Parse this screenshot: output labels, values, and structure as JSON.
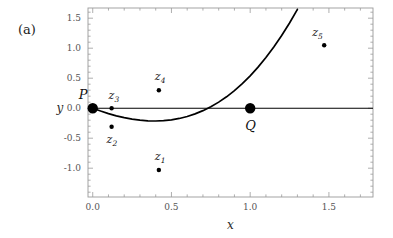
{
  "figure": {
    "panel_label": "(a)",
    "background": "#ffffff",
    "curve_color": "#000000",
    "frame_color": "#9a9a9a",
    "axis_line_color": "#000000",
    "point_color": "#000000"
  },
  "chart_data": {
    "type": "scatter",
    "title": "",
    "xlabel": "x",
    "ylabel": "y",
    "xlim": [
      -0.03,
      1.78
    ],
    "ylim": [
      -1.48,
      1.67
    ],
    "grid": false,
    "legend": null,
    "xticks": [
      0.0,
      0.5,
      1.0,
      1.5
    ],
    "xtick_labels": [
      "0.0",
      "0.5",
      "1.0",
      "1.5"
    ],
    "yticks": [
      -1.0,
      -0.5,
      0.0,
      0.5,
      1.0,
      1.5
    ],
    "ytick_labels": [
      "-1.0",
      "-0.5",
      "0.0",
      "0.5",
      "1.0",
      "1.5"
    ],
    "minor_tick_step_x": 0.1,
    "minor_tick_step_y": 0.1,
    "curve": {
      "name": "elliptic-curve",
      "equation": "y = x(x-1)(x+1.55)/1.55",
      "x_range": [
        0.0,
        1.63
      ],
      "points": [
        [
          0.0,
          0.0
        ],
        [
          0.05,
          -0.047
        ],
        [
          0.1,
          -0.09
        ],
        [
          0.15,
          -0.127
        ],
        [
          0.2,
          -0.158
        ],
        [
          0.25,
          -0.182
        ],
        [
          0.3,
          -0.2
        ],
        [
          0.35,
          -0.21
        ],
        [
          0.4,
          -0.213
        ],
        [
          0.45,
          -0.208
        ],
        [
          0.5,
          -0.194
        ],
        [
          0.55,
          -0.171
        ],
        [
          0.6,
          -0.138
        ],
        [
          0.65,
          -0.095
        ],
        [
          0.7,
          -0.041
        ],
        [
          0.75,
          0.024
        ],
        [
          0.8,
          0.101
        ],
        [
          0.85,
          0.19
        ],
        [
          0.9,
          0.293
        ],
        [
          0.95,
          0.409
        ],
        [
          1.0,
          0.539
        ],
        [
          1.05,
          0.684
        ],
        [
          1.1,
          0.844
        ],
        [
          1.15,
          1.02
        ],
        [
          1.2,
          1.212
        ],
        [
          1.25,
          1.421
        ],
        [
          1.3,
          1.647
        ]
      ]
    },
    "named_points": [
      {
        "label": "P",
        "sub": "",
        "x": 0.0,
        "y": 0.0,
        "size": "large",
        "label_dx": -14,
        "label_dy": -9
      },
      {
        "label": "Q",
        "sub": "",
        "x": 1.0,
        "y": 0.0,
        "size": "large",
        "label_dx": -5,
        "label_dy": 22
      },
      {
        "label": "z",
        "sub": "1",
        "x": 0.42,
        "y": -1.03,
        "size": "small",
        "label_dx": -4,
        "label_dy": -10
      },
      {
        "label": "z",
        "sub": "2",
        "x": 0.12,
        "y": -0.31,
        "size": "small",
        "label_dx": -5,
        "label_dy": 16
      },
      {
        "label": "z",
        "sub": "3",
        "x": 0.12,
        "y": 0.0,
        "size": "small",
        "label_dx": -3,
        "label_dy": -9
      },
      {
        "label": "z",
        "sub": "4",
        "x": 0.42,
        "y": 0.3,
        "size": "small",
        "label_dx": -4,
        "label_dy": -10
      },
      {
        "label": "z",
        "sub": "5",
        "x": 1.47,
        "y": 1.05,
        "size": "small",
        "label_dx": -12,
        "label_dy": -9
      }
    ]
  }
}
